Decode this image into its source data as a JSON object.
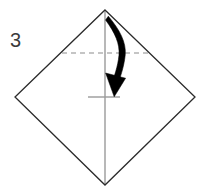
{
  "canvas": {
    "width": 210,
    "height": 193,
    "background_color": "#ffffff"
  },
  "step": {
    "number_label": "3"
  },
  "colors": {
    "paper_outline": "#2b2b2b",
    "crease_dashed": "#8c8c8c",
    "center_line": "#9a9a9a",
    "tick_mark": "#9a9a9a",
    "arrow": "#000000",
    "label_text": "#3b3b3b"
  },
  "shapes": {
    "paper_outline": {
      "name": "square-rotated-45",
      "points": "105,10 195,97 105,185 15,97",
      "stroke_width": 1.3
    },
    "vertical_center_line": {
      "x": 105,
      "y1": 10,
      "y2": 185,
      "stroke_width": 1.4
    },
    "dashed_crease_line": {
      "y": 53,
      "x1": 62,
      "x2": 148,
      "dash_pattern": "5,4",
      "stroke_width": 1.1
    },
    "target_tick_mark": {
      "y": 97,
      "x1": 88,
      "x2": 120,
      "stroke_width": 1.4
    },
    "fold_arrow": {
      "path": "M109.5,17 C120,30 126,42 124.5,54 C123,68 118,82 115.5,90",
      "stroke_width_start": 1.6,
      "stroke_width_end": 4.2,
      "arrowhead_tip": "114,96.5",
      "arrowhead_points": "106.5,74 124,79.5 114,96.5"
    }
  },
  "annotations": {
    "diagram_kind": "origami-fold-step",
    "description_visible_text": "3"
  }
}
